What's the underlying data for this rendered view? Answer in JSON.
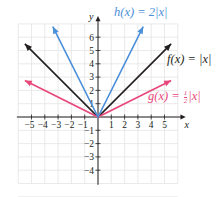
{
  "chart_data": {
    "type": "line",
    "title": "",
    "xlabel": "x",
    "ylabel": "y",
    "xlim": [
      -6,
      6
    ],
    "ylim": [
      -5,
      7
    ],
    "grid": true,
    "x_ticks": [
      -5,
      -4,
      -3,
      -2,
      -1,
      1,
      2,
      3,
      4,
      5
    ],
    "y_ticks": [
      -4,
      -3,
      -2,
      -1,
      1,
      2,
      3,
      4,
      5,
      6
    ],
    "series": [
      {
        "name": "f(x) = |x|",
        "color": "#231f20",
        "x": [
          -5.5,
          0,
          5.5
        ],
        "y": [
          5.5,
          0,
          5.5
        ]
      },
      {
        "name": "g(x) = 1/2|x|",
        "color": "#e8477a",
        "x": [
          -5.5,
          0,
          5.5
        ],
        "y": [
          2.75,
          0,
          2.75
        ]
      },
      {
        "name": "h(x) = 2|x|",
        "color": "#4a90d9",
        "x": [
          -3.4,
          0,
          3.4
        ],
        "y": [
          6.8,
          0,
          6.8
        ]
      }
    ],
    "annotations": [
      {
        "text": "h(x) = 2|x|",
        "position": "top"
      },
      {
        "text": "f(x) = |x|",
        "position": "right"
      },
      {
        "text": "g(x) = 1/2|x|",
        "position": "right-lower"
      }
    ]
  },
  "labels": {
    "x_axis": "x",
    "y_axis": "y",
    "h_prefix": "h(x) = 2|x|",
    "f_label": "f(x) = |x|",
    "g_prefix": "g(x) = ",
    "g_num": "1",
    "g_den": "2",
    "g_suffix": "|x|"
  },
  "colors": {
    "f": "#231f20",
    "g": "#e8477a",
    "h": "#4a90d9",
    "grid": "#e4e4e4",
    "axis": "#231f20"
  }
}
